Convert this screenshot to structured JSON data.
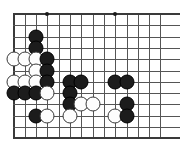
{
  "board": {
    "title": "Go board diagram",
    "game": "Go",
    "partial_board": true,
    "geometry": {
      "origin_x": 13.5,
      "origin_y": 14.0,
      "spacing": 11.3,
      "cols": 14,
      "rows": 12,
      "stone_diameter": 15
    },
    "edges": {
      "left": true,
      "top": true,
      "bottom": true,
      "right": false
    },
    "colors": {
      "background": "#ffffff",
      "grid_line": "#555555",
      "edge_line": "#3a3a3a",
      "black_stone": "#1c1c1c",
      "white_stone": "#fdfdfd",
      "white_stone_border": "#3a3a3a",
      "star_point": "#1a1a1a"
    },
    "star_points": [
      {
        "col": 4,
        "row": 1
      },
      {
        "col": 10,
        "row": 1
      },
      {
        "col": 10,
        "row": 7
      }
    ],
    "stones": [
      {
        "color": "black",
        "col": 3,
        "row": 3
      },
      {
        "color": "black",
        "col": 3,
        "row": 4
      },
      {
        "color": "white",
        "col": 1,
        "row": 5
      },
      {
        "color": "white",
        "col": 2,
        "row": 5
      },
      {
        "color": "white",
        "col": 3,
        "row": 5
      },
      {
        "color": "black",
        "col": 4,
        "row": 5
      },
      {
        "color": "white",
        "col": 3,
        "row": 6
      },
      {
        "color": "black",
        "col": 4,
        "row": 6
      },
      {
        "color": "white",
        "col": 1,
        "row": 7
      },
      {
        "color": "white",
        "col": 2,
        "row": 7
      },
      {
        "color": "white",
        "col": 3,
        "row": 7
      },
      {
        "color": "black",
        "col": 4,
        "row": 7
      },
      {
        "color": "black",
        "col": 6,
        "row": 7
      },
      {
        "color": "black",
        "col": 7,
        "row": 7
      },
      {
        "color": "black",
        "col": 10,
        "row": 7
      },
      {
        "color": "black",
        "col": 11,
        "row": 7
      },
      {
        "color": "black",
        "col": 1,
        "row": 8
      },
      {
        "color": "black",
        "col": 2,
        "row": 8
      },
      {
        "color": "black",
        "col": 3,
        "row": 8
      },
      {
        "color": "white",
        "col": 4,
        "row": 8
      },
      {
        "color": "black",
        "col": 6,
        "row": 8
      },
      {
        "color": "black",
        "col": 6,
        "row": 9
      },
      {
        "color": "white",
        "col": 7,
        "row": 9
      },
      {
        "color": "white",
        "col": 8,
        "row": 9
      },
      {
        "color": "black",
        "col": 11,
        "row": 9
      },
      {
        "color": "black",
        "col": 3,
        "row": 10
      },
      {
        "color": "white",
        "col": 4,
        "row": 10
      },
      {
        "color": "white",
        "col": 6,
        "row": 10
      },
      {
        "color": "white",
        "col": 10,
        "row": 10
      },
      {
        "color": "black",
        "col": 11,
        "row": 10
      }
    ]
  },
  "chart_data": {
    "type": "table",
    "xlabel": "board column",
    "ylabel": "board row",
    "columns": [
      "color",
      "col",
      "row"
    ],
    "black_count": 17,
    "white_count": 13,
    "total_stones": 30
  }
}
